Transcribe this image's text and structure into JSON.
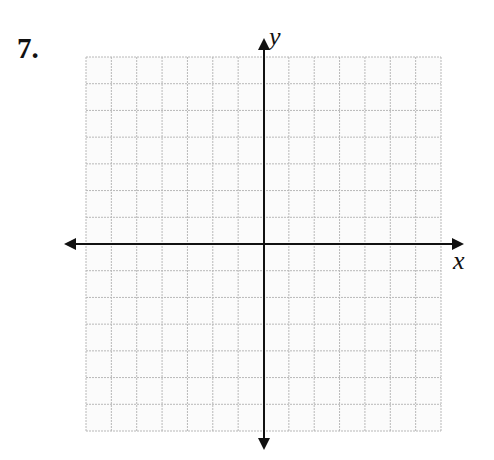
{
  "problem": {
    "number_label": "7."
  },
  "graph": {
    "x_axis_label": "x",
    "y_axis_label": "y",
    "grid": {
      "columns": 14,
      "rows": 14,
      "left": 86,
      "top": 57,
      "right": 441,
      "bottom": 431,
      "line_color": "#b8b8b8",
      "background": "#fbfbfb"
    },
    "axes": {
      "origin_x": 264,
      "origin_y": 244,
      "x_min_px": 64,
      "x_max_px": 464,
      "y_min_px": 38,
      "y_max_px": 450,
      "color": "#111111"
    }
  }
}
